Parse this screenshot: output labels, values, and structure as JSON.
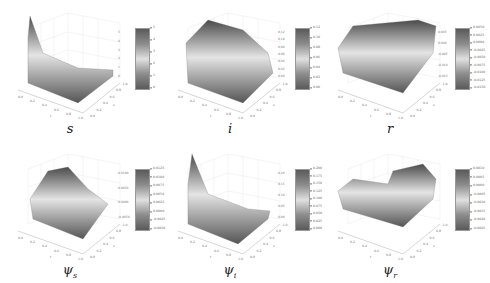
{
  "figure": {
    "panels": [
      {
        "id": "s",
        "label": "s",
        "sub": "",
        "colorbar": [
          "5",
          "4",
          "3",
          "2",
          "1",
          "0"
        ],
        "zticks": [
          "5",
          "4",
          "3",
          "2",
          "1",
          "0"
        ]
      },
      {
        "id": "i",
        "label": "i",
        "sub": "",
        "colorbar": [
          "0.12",
          "0.10",
          "0.08",
          "0.06",
          "0.04",
          "0.02",
          "0.00"
        ],
        "zticks": [
          "0.12",
          "0.10",
          "0.08",
          "0.06",
          "0.04",
          "0.02",
          "0.00"
        ]
      },
      {
        "id": "r",
        "label": "r",
        "sub": "",
        "colorbar": [
          "0.0050",
          "0.0025",
          "0.0000",
          "-0.0025",
          "-0.0050",
          "-0.0075",
          "-0.0100",
          "-0.0125",
          "-0.0150"
        ],
        "zticks": [
          "0.005",
          "0.000",
          "-0.005",
          "-0.010",
          "-0.015"
        ]
      },
      {
        "id": "psi_s",
        "label": "ψ",
        "sub": "s",
        "colorbar": [
          "0.0125",
          "0.0100",
          "0.0075",
          "0.0050",
          "0.0025",
          "0.0000",
          "-0.0025",
          "-0.0050"
        ],
        "zticks": [
          "0.0100",
          "0.0050",
          "0.0000",
          "-0.0050"
        ]
      },
      {
        "id": "psi_i",
        "label": "ψ",
        "sub": "i",
        "colorbar": [
          "0.200",
          "0.175",
          "0.150",
          "0.125",
          "0.100",
          "0.075",
          "0.050",
          "0.025",
          "0.000"
        ],
        "zticks": [
          "0.20",
          "0.15",
          "0.10",
          "0.05",
          "0.00"
        ]
      },
      {
        "id": "psi_r",
        "label": "ψ",
        "sub": "r",
        "colorbar": [
          "0.0010",
          "0.0005",
          "0.0000",
          "-0.0005",
          "-0.0010",
          "-0.0015",
          "-0.0020",
          "-0.0025"
        ],
        "zticks": [
          "",
          "",
          "",
          "",
          "",
          "",
          "",
          ""
        ]
      }
    ],
    "t_ticks": [
      "0.0",
      "0.2",
      "0.4",
      "0.6",
      "0.8",
      "1.0"
    ],
    "x_ticks": [
      "0.0",
      "0.2",
      "0.4",
      "0.6",
      "0.8",
      "1.0"
    ],
    "t_label": "t",
    "x_label": "x"
  },
  "chart_data": [
    {
      "type": "surface",
      "title": "s",
      "xlabel": "t",
      "ylabel": "x",
      "zlim": [
        0,
        5
      ],
      "colorbar_ticks": [
        0,
        1,
        2,
        3,
        4,
        5
      ],
      "description": "Peak near t=0, decays rapidly to ~0 along t"
    },
    {
      "type": "surface",
      "title": "i",
      "xlabel": "t",
      "ylabel": "x",
      "zlim": [
        0,
        0.12
      ],
      "colorbar_ticks": [
        0.0,
        0.02,
        0.04,
        0.06,
        0.08,
        0.1,
        0.12
      ],
      "description": "Wavy surface with maximum ~0.12 at early t"
    },
    {
      "type": "surface",
      "title": "r",
      "xlabel": "t",
      "ylabel": "x",
      "zlim": [
        -0.015,
        0.005
      ],
      "colorbar_ticks": [
        -0.015,
        -0.0125,
        -0.01,
        -0.0075,
        -0.005,
        -0.0025,
        0.0,
        0.0025,
        0.005
      ],
      "description": "Mostly flat near 0 with sharp negative dip near t=0"
    },
    {
      "type": "surface",
      "title": "ψ_s",
      "xlabel": "t",
      "ylabel": "x",
      "zlim": [
        -0.005,
        0.0125
      ],
      "colorbar_ticks": [
        -0.005,
        -0.0025,
        0.0,
        0.0025,
        0.005,
        0.0075,
        0.01,
        0.0125
      ],
      "description": "Rising ridge with max ~0.0125"
    },
    {
      "type": "surface",
      "title": "ψ_i",
      "xlabel": "t",
      "ylabel": "x",
      "zlim": [
        0,
        0.2
      ],
      "colorbar_ticks": [
        0.0,
        0.025,
        0.05,
        0.075,
        0.1,
        0.125,
        0.15,
        0.175,
        0.2
      ],
      "description": "Peak near t=0 decaying to ~0"
    },
    {
      "type": "surface",
      "title": "ψ_r",
      "xlabel": "t",
      "ylabel": "x",
      "zlim": [
        -0.0025,
        0.001
      ],
      "colorbar_ticks": [
        -0.0025,
        -0.002,
        -0.0015,
        -0.001,
        -0.0005,
        0.0,
        0.0005,
        0.001
      ],
      "description": "Two stepped plateaus with spiky dips"
    }
  ]
}
